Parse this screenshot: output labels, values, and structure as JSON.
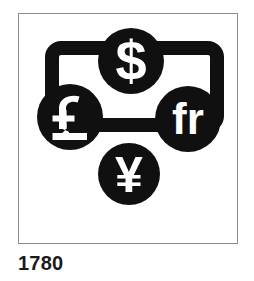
{
  "figure": {
    "caption": "1780",
    "frame_color": "#8c8c8c",
    "ink_color": "#101010",
    "background_color": "#ffffff"
  },
  "pictogram": {
    "banknote": {
      "name": "banknote-outline",
      "shape": "rounded-rectangle",
      "stroke_color": "#101010"
    },
    "coins": [
      {
        "id": "dollar",
        "symbol": "$",
        "label": "dollar",
        "position": "top-center",
        "fill_color": "#101010",
        "glyph_color": "#ffffff"
      },
      {
        "id": "pound",
        "symbol": "£",
        "label": "pound",
        "position": "left",
        "fill_color": "#101010",
        "glyph_color": "#ffffff"
      },
      {
        "id": "franc",
        "symbol": "fr",
        "label": "franc",
        "position": "right",
        "fill_color": "#101010",
        "glyph_color": "#ffffff"
      },
      {
        "id": "yen",
        "symbol": "¥",
        "label": "yen",
        "position": "bottom-center",
        "fill_color": "#101010",
        "glyph_color": "#ffffff"
      }
    ]
  }
}
